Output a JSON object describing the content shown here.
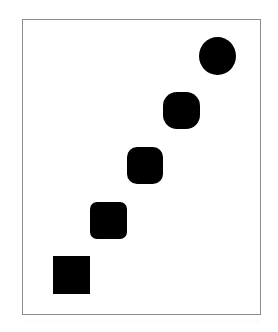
{
  "figure": {
    "background_color": "#ffffff",
    "frame": {
      "border_color": "#8c8c8c",
      "border_width_px": 1,
      "fill_color": "#ffffff",
      "x": 22,
      "y": 19,
      "width": 239,
      "height": 296
    },
    "shape_color": "#000000",
    "shape_count": 5,
    "arrangement": "diagonal, ascending left-to-right from bottom-left to top-right",
    "shapes": [
      {
        "index": 1,
        "name": "square",
        "label": "square",
        "corner_radius_px": 0,
        "x": 53,
        "y": 256,
        "width": 37,
        "height": 38,
        "radius_css": "0px",
        "color": "#000000"
      },
      {
        "index": 2,
        "name": "rounded-square-small-radius",
        "label": "rounded square",
        "corner_radius_px": 7,
        "x": 90,
        "y": 202,
        "width": 37,
        "height": 37,
        "radius_css": "7px",
        "color": "#000000"
      },
      {
        "index": 3,
        "name": "rounded-square-medium-radius",
        "label": "rounded square",
        "corner_radius_px": 10,
        "x": 127,
        "y": 147,
        "width": 36,
        "height": 37,
        "radius_css": "10px",
        "color": "#000000"
      },
      {
        "index": 4,
        "name": "squircle-large-radius",
        "label": "squircle",
        "corner_radius_px": 14,
        "x": 163,
        "y": 92,
        "width": 37,
        "height": 37,
        "radius_css": "14px",
        "color": "#000000"
      },
      {
        "index": 5,
        "name": "circle",
        "label": "circle",
        "corner_radius_px": 19,
        "x": 199,
        "y": 37,
        "width": 37,
        "height": 38,
        "radius_css": "50%",
        "color": "#000000"
      }
    ]
  }
}
